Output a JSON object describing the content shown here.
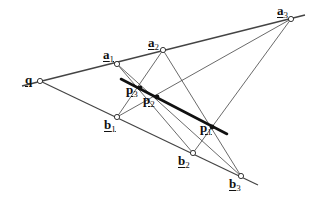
{
  "diagram": {
    "colors": {
      "line": "#444444",
      "thick_line": "#111111",
      "point_fill": "#ffffff",
      "point_stroke": "#222222",
      "dot_fill": "#111111"
    },
    "points": {
      "q": {
        "x": 40,
        "y": 81,
        "label": "q",
        "sub": "",
        "style": "open",
        "lx": 25,
        "ly": 73
      },
      "a1": {
        "x": 117,
        "y": 64,
        "label": "a",
        "sub": "1",
        "style": "open",
        "lx": 103,
        "ly": 48
      },
      "a2": {
        "x": 163,
        "y": 50,
        "label": "a",
        "sub": "2",
        "style": "open",
        "lx": 148,
        "ly": 36
      },
      "a3": {
        "x": 291,
        "y": 19,
        "label": "a",
        "sub": "3",
        "style": "open",
        "lx": 277,
        "ly": 4
      },
      "b1": {
        "x": 117,
        "y": 117,
        "label": "b",
        "sub": "1",
        "style": "open",
        "lx": 104,
        "ly": 118
      },
      "b2": {
        "x": 193,
        "y": 153,
        "label": "b",
        "sub": "2",
        "style": "open",
        "lx": 178,
        "ly": 154
      },
      "b3": {
        "x": 241,
        "y": 176,
        "label": "b",
        "sub": "3",
        "style": "open",
        "lx": 229,
        "ly": 177
      },
      "p1": {
        "x": 212,
        "y": 127,
        "label": "p",
        "sub": "1",
        "style": "dot",
        "lx": 200,
        "ly": 121
      },
      "p2": {
        "x": 157,
        "y": 97,
        "label": "p",
        "sub": "2",
        "style": "dot",
        "lx": 143,
        "ly": 93
      },
      "p3": {
        "x": 140,
        "y": 88,
        "label": "p",
        "sub": "3",
        "style": "dot",
        "lx": 126,
        "ly": 83
      }
    },
    "lines": [
      {
        "id": "line-q-a",
        "x1": 22,
        "y1": 86,
        "x2": 305,
        "y2": 15,
        "w": 1.4
      },
      {
        "id": "line-q-b",
        "x1": 40,
        "y1": 81,
        "x2": 258,
        "y2": 185,
        "w": 1.2
      },
      {
        "id": "line-a1-b2",
        "x1": 117,
        "y1": 64,
        "x2": 193,
        "y2": 153,
        "w": 0.8
      },
      {
        "id": "line-a1-b3",
        "x1": 117,
        "y1": 64,
        "x2": 241,
        "y2": 176,
        "w": 0.8
      },
      {
        "id": "line-a2-b1",
        "x1": 163,
        "y1": 50,
        "x2": 117,
        "y2": 117,
        "w": 0.8
      },
      {
        "id": "line-a2-b3",
        "x1": 163,
        "y1": 50,
        "x2": 241,
        "y2": 176,
        "w": 0.8
      },
      {
        "id": "line-a3-b1",
        "x1": 291,
        "y1": 19,
        "x2": 117,
        "y2": 117,
        "w": 0.8
      },
      {
        "id": "line-a3-b2",
        "x1": 291,
        "y1": 19,
        "x2": 193,
        "y2": 153,
        "w": 0.8
      }
    ],
    "thick_line": {
      "id": "line-p",
      "x1": 121,
      "y1": 79,
      "x2": 227,
      "y2": 134,
      "w": 2.6
    }
  }
}
